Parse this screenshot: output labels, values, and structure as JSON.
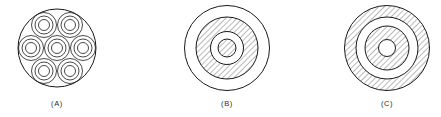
{
  "figure": {
    "background_color": "#ffffff",
    "stroke_color": "#1a1a1a",
    "hatch_color": "#3a3a3a",
    "captions": [
      {
        "label": "(A)",
        "cx": 57,
        "y": 100
      },
      {
        "label": "(B)",
        "cx": 227,
        "y": 100
      },
      {
        "label": "(C)",
        "cx": 387,
        "y": 100
      }
    ],
    "diagrams": [
      {
        "id": "A",
        "name": "multi-core-bundle-cross-section",
        "center": {
          "x": 57,
          "y": 48
        },
        "outer_radius": 39,
        "outer_fill": "none",
        "sub_cores": {
          "count": 7,
          "ring_radii": [
            12.5,
            9.0,
            5.5
          ],
          "fill": "none",
          "positions": [
            {
              "x": 44,
              "y": 25
            },
            {
              "x": 70,
              "y": 25
            },
            {
              "x": 31,
              "y": 48
            },
            {
              "x": 57,
              "y": 48
            },
            {
              "x": 83,
              "y": 48
            },
            {
              "x": 44,
              "y": 71
            },
            {
              "x": 70,
              "y": 71
            }
          ]
        }
      },
      {
        "id": "B",
        "name": "concentric-cross-section-hatched-inner",
        "center": {
          "x": 227,
          "y": 48
        },
        "rings": [
          {
            "radius": 42.5,
            "fill": "none"
          },
          {
            "radius": 31.0,
            "fill": "hatch"
          },
          {
            "radius": 16.5,
            "fill": "none"
          },
          {
            "radius": 9.0,
            "fill": "hatch"
          }
        ]
      },
      {
        "id": "C",
        "name": "concentric-cross-section-hatched-outer",
        "center": {
          "x": 387,
          "y": 48
        },
        "rings": [
          {
            "radius": 42.5,
            "fill": "hatch"
          },
          {
            "radius": 31.0,
            "fill": "none"
          },
          {
            "radius": 22.0,
            "fill": "hatch"
          },
          {
            "radius": 8.5,
            "fill": "none"
          }
        ]
      }
    ]
  }
}
